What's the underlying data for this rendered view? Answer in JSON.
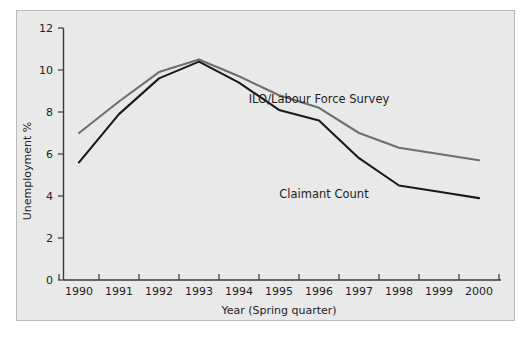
{
  "chart_data": {
    "type": "line",
    "title": "",
    "xlabel": "Year (Spring quarter)",
    "ylabel": "Unemployment %",
    "categories": [
      "1990",
      "1991",
      "1992",
      "1993",
      "1994",
      "1995",
      "1996",
      "1997",
      "1998",
      "1999",
      "2000"
    ],
    "ylim": [
      0,
      12
    ],
    "yticks": [
      0,
      2,
      4,
      6,
      8,
      10,
      12
    ],
    "yticklabels": [
      "0",
      "2",
      "4",
      "6",
      "8",
      "10",
      "12"
    ],
    "grid": false,
    "legend": "inline-annotations",
    "series": [
      {
        "name": "ILO/Labour Force Survey",
        "color": "#6e6e6e",
        "values": [
          7.0,
          8.5,
          9.9,
          10.5,
          9.7,
          8.8,
          8.2,
          7.0,
          6.3,
          6.0,
          5.7
        ]
      },
      {
        "name": "Claimant Count",
        "color": "#1a1a1a",
        "values": [
          5.6,
          7.9,
          9.6,
          10.4,
          9.4,
          8.1,
          7.6,
          5.8,
          4.5,
          4.2,
          3.9
        ]
      }
    ],
    "annotations": [
      {
        "text": "ILO/Labour Force Survey",
        "x": 1996.0,
        "y": 9.3
      },
      {
        "text": "Claimant Count",
        "x": 1996.3,
        "y": 5.3
      }
    ]
  },
  "axis": {
    "y_tick_0": "0",
    "y_tick_2": "2",
    "y_tick_4": "4",
    "y_tick_6": "6",
    "y_tick_8": "8",
    "y_tick_10": "10",
    "y_tick_12": "12",
    "x_tick_1990": "1990",
    "x_tick_1991": "1991",
    "x_tick_1992": "1992",
    "x_tick_1993": "1993",
    "x_tick_1994": "1994",
    "x_tick_1995": "1995",
    "x_tick_1996": "1996",
    "x_tick_1997": "1997",
    "x_tick_1998": "1998",
    "x_tick_1999": "1999",
    "x_tick_2000": "2000",
    "x_title": "Year (Spring quarter)",
    "y_title": "Unemployment %"
  },
  "labels": {
    "ilo": "ILO/Labour Force Survey",
    "claimant": "Claimant Count"
  }
}
